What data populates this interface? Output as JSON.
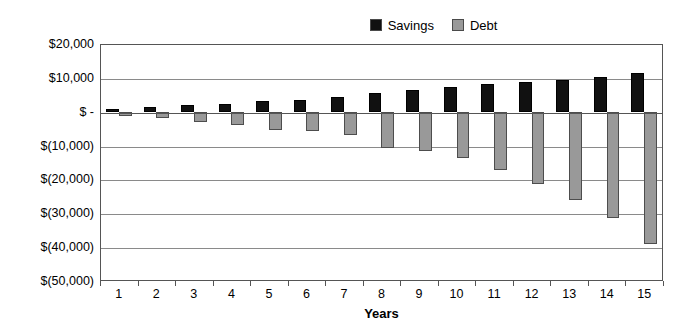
{
  "chart_data": {
    "type": "bar",
    "title": "",
    "xlabel": "Years",
    "ylabel": "",
    "categories": [
      "1",
      "2",
      "3",
      "4",
      "5",
      "6",
      "7",
      "8",
      "9",
      "10",
      "11",
      "12",
      "13",
      "14",
      "15"
    ],
    "series": [
      {
        "name": "Savings",
        "color": "#111111",
        "values": [
          800,
          1300,
          2000,
          2300,
          3100,
          3600,
          4400,
          5500,
          6400,
          7300,
          8200,
          8900,
          9400,
          10200,
          11300
        ]
      },
      {
        "name": "Debt",
        "color": "#999999",
        "values": [
          -1400,
          -1800,
          -3000,
          -3800,
          -5400,
          -5600,
          -6900,
          -10800,
          -11700,
          -13800,
          -17200,
          -21300,
          -26000,
          -31500,
          -39000
        ]
      }
    ],
    "ylim": [
      -50000,
      20000
    ],
    "ytick_labels": [
      "$20,000",
      "$10,000",
      "$ -",
      "$(10,000)",
      "$(20,000)",
      "$(30,000)",
      "$(40,000)",
      "$(50,000)"
    ],
    "ytick_values": [
      20000,
      10000,
      0,
      -10000,
      -20000,
      -30000,
      -40000,
      -50000
    ],
    "grid": true,
    "legend_position": "top-right",
    "legend": [
      {
        "label": "Savings",
        "color": "#111111"
      },
      {
        "label": "Debt",
        "color": "#999999"
      }
    ]
  }
}
